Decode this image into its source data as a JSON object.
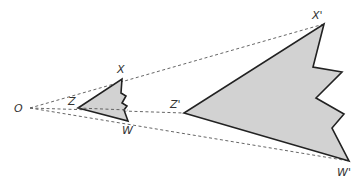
{
  "diagram": {
    "colors": {
      "fill": "#d2d2d2",
      "stroke": "#222222",
      "ray": "#555555",
      "label": "#333333"
    },
    "center": {
      "label": "O",
      "x": 28,
      "y": 108
    },
    "original": {
      "labels": {
        "X": "X",
        "Z": "Z",
        "W": "W"
      },
      "points": "122,79 121,93 126,96 122,103 127,106 124,110 128,121 78,108"
    },
    "image": {
      "labels": {
        "X": "X'",
        "Z": "Z'",
        "W": "W'"
      },
      "points": "324,24 313,67 342,72 316,98 344,114 332,128 349,161 184,113"
    }
  }
}
